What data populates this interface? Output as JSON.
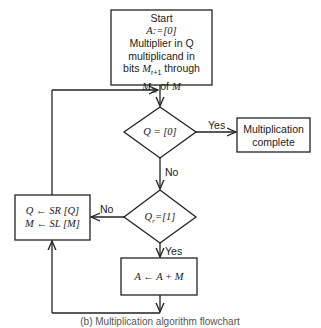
{
  "flowchart": {
    "start_box": {
      "lines": [
        "Start",
        "A := [0]",
        "Multiplier in Q",
        "multiplicand in",
        "bits M_{r+1} through",
        "M_{2r} of M"
      ]
    },
    "decision_zero": {
      "text": "Q = [0]",
      "yes_label": "Yes",
      "no_label": "No"
    },
    "complete_box": {
      "lines": [
        "Multiplication",
        "complete"
      ]
    },
    "decision_bit": {
      "text": "Q_r = [1]",
      "yes_label": "Yes",
      "no_label": "No"
    },
    "shift_box": {
      "lines": [
        "Q ← SR [Q]",
        "M ← SL [M]"
      ]
    },
    "add_box": {
      "text": "A ← A + M"
    }
  },
  "caption": "(b) Multiplication algorithm flowchart"
}
